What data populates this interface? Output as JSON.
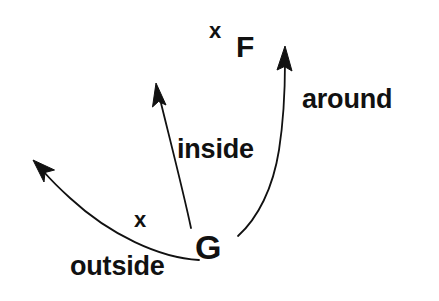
{
  "figure": {
    "title": "",
    "background_color": "#ffffff",
    "stroke_color": "#111111",
    "text_color": "#111111",
    "width": 439,
    "height": 301
  },
  "points": [
    {
      "id": "g",
      "label": "G",
      "marker": "",
      "position": {
        "x": 210,
        "y": 250
      },
      "role": "source-point"
    },
    {
      "id": "f",
      "label": "F",
      "marker": "x",
      "position": {
        "x": 247,
        "y": 47
      },
      "role": "target-point"
    },
    {
      "id": "unlabeled-lower",
      "label": "",
      "marker": "x",
      "position": {
        "x": 143,
        "y": 220
      },
      "role": "marked-point"
    }
  ],
  "markers": {
    "x_top": "x",
    "x_bottom": "x"
  },
  "arrows": [
    {
      "id": "inside",
      "label": "inside",
      "style": "straight",
      "start": {
        "x": 191,
        "y": 228
      },
      "end": {
        "x": 157,
        "y": 86
      },
      "head": "filled-triangle",
      "label_position": {
        "x": 177,
        "y": 136
      }
    },
    {
      "id": "around",
      "label": "around",
      "style": "curved-right",
      "start": {
        "x": 238,
        "y": 236
      },
      "end": {
        "x": 286,
        "y": 50
      },
      "head": "filled-triangle",
      "label_position": {
        "x": 302,
        "y": 86
      }
    },
    {
      "id": "outside",
      "label": "outside",
      "style": "curved-down-left",
      "start": {
        "x": 197,
        "y": 259
      },
      "end": {
        "x": 37,
        "y": 162
      },
      "head": "filled-triangle",
      "label_position": {
        "x": 70,
        "y": 253
      }
    }
  ]
}
